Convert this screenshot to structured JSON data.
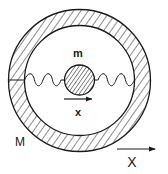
{
  "diagram": {
    "labels": {
      "inner_mass": "m",
      "inner_displacement": "x",
      "outer_mass": "M",
      "outer_displacement": "X"
    },
    "components": [
      "outer-ring-mass-M",
      "inner-ball-mass-m",
      "left-spring",
      "right-spring",
      "inner-displacement-arrow",
      "outer-displacement-arrow"
    ],
    "colors": {
      "stroke": "#1a1a1a",
      "background": "#ffffff"
    }
  }
}
